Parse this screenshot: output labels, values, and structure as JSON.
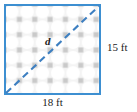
{
  "figure": {
    "diagonal_label": "d",
    "height_label": "15 ft",
    "width_label": "18 ft"
  },
  "geometry": {
    "width_ft": 18,
    "height_ft": 15,
    "diagonal_variable": "d"
  },
  "colors": {
    "border": "#3d8fd1",
    "diagonal": "#3d7fc1",
    "tile_background": "#f2f2f2",
    "tile_circle": "#ffffff",
    "tile_square": "#c9c9c9",
    "text": "#1a1a1a",
    "page_background": "#ffffff"
  },
  "pattern": {
    "name": "circle-and-square-tile",
    "cell_size_px": 16
  }
}
